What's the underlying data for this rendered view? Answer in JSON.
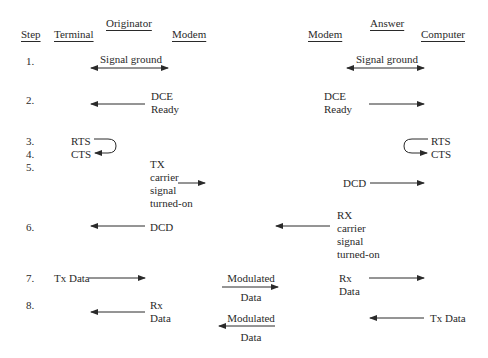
{
  "headers": {
    "step": "Step",
    "terminal": "Terminal",
    "originator": "Originator",
    "modem_left": "Modem",
    "answer": "Answer",
    "modem_right": "Modem",
    "computer": "Computer"
  },
  "steps": [
    {
      "num": "1.",
      "left_label": "Signal ground",
      "right_label": "Signal ground",
      "direction": "bidirectional"
    },
    {
      "num": "2.",
      "left_label": [
        "DCE",
        "Ready"
      ],
      "right_label": [
        "DCE",
        "Ready"
      ],
      "left_direction": "to-terminal",
      "right_direction": "to-computer"
    },
    {
      "num": "3.",
      "left_label": "RTS",
      "right_label": "RTS"
    },
    {
      "num": "4.",
      "left_label": "CTS",
      "right_label": "CTS"
    },
    {
      "num": "5.",
      "left_label": [
        "TX",
        "carrier",
        "signal",
        "turned-on"
      ],
      "right_label": "DCD"
    },
    {
      "num": "6.",
      "left_label": "DCD",
      "right_label": [
        "RX",
        "carrier",
        "signal",
        "turned-on"
      ]
    },
    {
      "num": "7.",
      "left_label": "Tx Data",
      "middle_label": [
        "Modulated",
        "Data"
      ],
      "right_label": [
        "Rx",
        "Data"
      ]
    },
    {
      "num": "8.",
      "left_label": [
        "Rx",
        "Data"
      ],
      "middle_label": [
        "Modulated",
        "Data"
      ],
      "right_label": "Tx Data"
    }
  ],
  "colors": {
    "line": "#2a2a2a",
    "background": "#ffffff"
  }
}
